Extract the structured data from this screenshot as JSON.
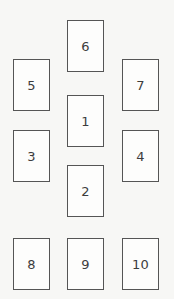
{
  "canvas": {
    "width": 174,
    "height": 299,
    "background_color": "#f7f7f5"
  },
  "style": {
    "card_fill": "#fdfdfc",
    "card_border_color": "#555555",
    "label_color": "#3c3c3c"
  },
  "board": {
    "name": "numbered-card-layout",
    "card_width": 37,
    "card_height": 52,
    "columns": {
      "left_x": 13,
      "center_x": 67,
      "right_x": 122
    },
    "cards": [
      {
        "label": "6",
        "x": 67,
        "y": 20,
        "column": "center",
        "row": 1
      },
      {
        "label": "5",
        "x": 13,
        "y": 59,
        "column": "left",
        "row": 2
      },
      {
        "label": "7",
        "x": 122,
        "y": 59,
        "column": "right",
        "row": 2
      },
      {
        "label": "1",
        "x": 67,
        "y": 95,
        "column": "center",
        "row": 3
      },
      {
        "label": "3",
        "x": 13,
        "y": 130,
        "column": "left",
        "row": 4
      },
      {
        "label": "4",
        "x": 122,
        "y": 130,
        "column": "right",
        "row": 4
      },
      {
        "label": "2",
        "x": 67,
        "y": 165,
        "column": "center",
        "row": 5
      },
      {
        "label": "8",
        "x": 13,
        "y": 238,
        "column": "left",
        "row": 6
      },
      {
        "label": "9",
        "x": 67,
        "y": 238,
        "column": "center",
        "row": 6
      },
      {
        "label": "10",
        "x": 122,
        "y": 238,
        "column": "right",
        "row": 6
      }
    ]
  }
}
